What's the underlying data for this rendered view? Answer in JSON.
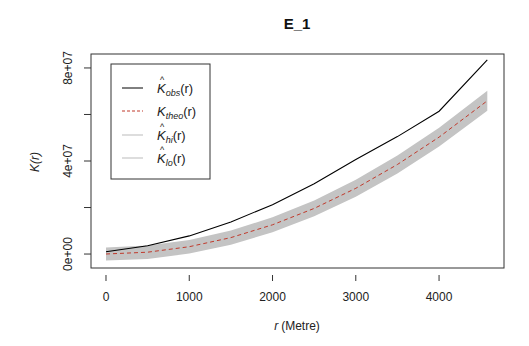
{
  "chart_data": {
    "type": "line",
    "title": "E_1",
    "xlabel_var": "r",
    "xlabel_unit": "(Metre)",
    "ylabel": "K(r)",
    "xlim": [
      -180,
      4780
    ],
    "ylim": [
      -6000000,
      86000000
    ],
    "x_ticks": [
      0,
      1000,
      2000,
      3000,
      4000
    ],
    "x_tick_labels": [
      "0",
      "1000",
      "2000",
      "3000",
      "4000"
    ],
    "y_ticks": [
      0,
      20000000,
      40000000,
      60000000,
      80000000
    ],
    "y_tick_labels": [
      "0e+00",
      "",
      "4e+07",
      "",
      "8e+07"
    ],
    "grid": false,
    "legend_position": "top-left",
    "legend": [
      {
        "key": "obs",
        "base": "K",
        "hat": true,
        "sub": "obs",
        "suffix": "(r)",
        "style": "solid",
        "color": "#000000"
      },
      {
        "key": "theo",
        "base": "K",
        "hat": false,
        "sub": "theo",
        "suffix": "(r)",
        "style": "dashed",
        "color": "#c0392b"
      },
      {
        "key": "hi",
        "base": "K",
        "hat": true,
        "sub": "hi",
        "suffix": "(r)",
        "style": "solid",
        "color": "#bbbbbb"
      },
      {
        "key": "lo",
        "base": "K",
        "hat": true,
        "sub": "lo",
        "suffix": "(r)",
        "style": "solid",
        "color": "#bbbbbb"
      }
    ],
    "x": [
      0,
      500,
      1000,
      1500,
      2000,
      2500,
      3000,
      3500,
      4000,
      4580
    ],
    "series": [
      {
        "name": "obs",
        "values": [
          1000000,
          3600000,
          7800000,
          13800000,
          21200000,
          30200000,
          40600000,
          50500000,
          61400000,
          83500000
        ]
      },
      {
        "name": "theo",
        "values": [
          0,
          785000,
          3140000,
          7070000,
          12570000,
          19630000,
          28270000,
          38480000,
          50270000,
          65900000
        ]
      },
      {
        "name": "hi",
        "values": [
          2800000,
          3650000,
          6100000,
          10150000,
          15800000,
          23050000,
          31900000,
          42300000,
          54300000,
          70200000
        ]
      },
      {
        "name": "lo",
        "values": [
          -2800000,
          -2080000,
          180000,
          3990000,
          9340000,
          16210000,
          24640000,
          34660000,
          46240000,
          61600000
        ]
      }
    ],
    "colors": {
      "band": "#c4c4c4",
      "axis": "#333333",
      "obs": "#000000",
      "theo": "#c0392b"
    }
  }
}
